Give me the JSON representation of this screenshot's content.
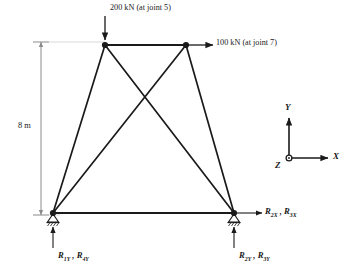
{
  "figure": {
    "type": "truss-free-body-diagram",
    "line_color": "#1a1a1a",
    "dimension_color": "#8a8a8a"
  },
  "loads": {
    "top_left": {
      "label": "200 kN (at joint 5)",
      "magnitude": "200 kN",
      "joint": "5",
      "direction": "down"
    },
    "top_right": {
      "label": "100 kN (at joint 7)",
      "magnitude": "100 kN",
      "joint": "7",
      "direction": "right"
    }
  },
  "dimension": {
    "height_label": "8 m"
  },
  "reactions": {
    "bottom_left_vertical": {
      "r1": "R",
      "r1_sub": "1Y",
      "sep": " , ",
      "r2": "R",
      "r2_sub": "4Y"
    },
    "bottom_right_vertical": {
      "r1": "R",
      "r1_sub": "2Y",
      "sep": " , ",
      "r2": "R",
      "r2_sub": "3Y"
    },
    "bottom_right_horizontal": {
      "r1": "R",
      "r1_sub": "2X",
      "sep": " , ",
      "r2": "R",
      "r2_sub": "3X"
    }
  },
  "axes": {
    "y_label": "Y",
    "x_label": "X",
    "z_label": "Z"
  },
  "geometry": {
    "joints": [
      {
        "name": "top-left",
        "x": 105,
        "y": 45
      },
      {
        "name": "top-right",
        "x": 186,
        "y": 45
      },
      {
        "name": "bottom-left",
        "x": 53,
        "y": 213
      },
      {
        "name": "bottom-right",
        "x": 234,
        "y": 213
      }
    ],
    "members": [
      {
        "name": "top-chord",
        "from": "top-left",
        "to": "top-right"
      },
      {
        "name": "bottom-chord",
        "from": "bottom-left",
        "to": "bottom-right"
      },
      {
        "name": "left-leg",
        "from": "top-left",
        "to": "bottom-left"
      },
      {
        "name": "right-leg",
        "from": "top-right",
        "to": "bottom-right"
      },
      {
        "name": "diagonal-left-down",
        "from": "top-left",
        "to": "bottom-right"
      },
      {
        "name": "diagonal-right-down",
        "from": "top-right",
        "to": "bottom-left"
      }
    ]
  }
}
